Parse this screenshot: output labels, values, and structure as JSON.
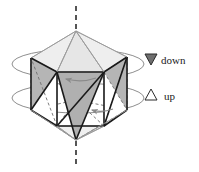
{
  "figure": {
    "solid": "icosahedron",
    "axis": {
      "name": "five-fold-rotation-axis",
      "style": "dashed",
      "orientation": "vertical",
      "color": "#555555"
    },
    "rotation_indicators": {
      "ellipse_count": 2,
      "color": "#8a8a8a",
      "arrow_count": 2,
      "arrow_direction": "left"
    },
    "colors": {
      "face_gray": "#b5b5b5",
      "face_light_gray": "#d6d6d6",
      "face_white": "#ffffff",
      "edge_dark": "#1a1a1a",
      "edge_light": "#9a9a9a",
      "dashed_edge": "#6e6e6e",
      "axis": "#555555",
      "text": "#1a1a1a"
    }
  },
  "legend": {
    "name": "orientation-legend",
    "items": [
      {
        "glyph": "triangle-down-filled",
        "symbol": "▼",
        "label": "down"
      },
      {
        "glyph": "triangle-up-outline",
        "symbol": "△",
        "label": "up"
      }
    ]
  },
  "geometry": {
    "top_apex": {
      "x": 76,
      "y": 31
    },
    "bottom_apex": {
      "x": 76,
      "y": 140
    },
    "upper_ring_y": 61,
    "lower_ring_y": 112,
    "upper_ring": [
      {
        "x": 31,
        "y": 58
      },
      {
        "x": 57,
        "y": 72
      },
      {
        "x": 104,
        "y": 72
      },
      {
        "x": 127,
        "y": 57
      },
      {
        "x": 76,
        "y": 47
      }
    ],
    "lower_ring": [
      {
        "x": 31,
        "y": 110
      },
      {
        "x": 57,
        "y": 126
      },
      {
        "x": 104,
        "y": 126
      },
      {
        "x": 127,
        "y": 110
      },
      {
        "x": 76,
        "y": 100
      }
    ]
  }
}
